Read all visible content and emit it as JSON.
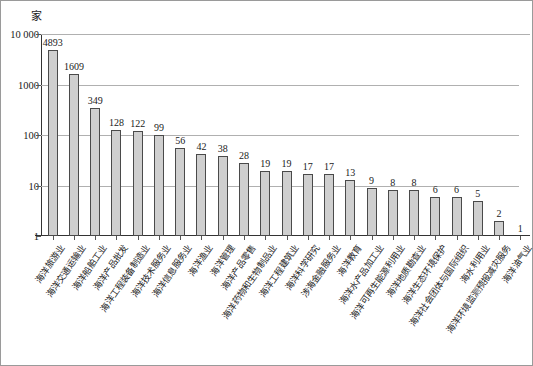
{
  "figure": {
    "unit_label": "家",
    "border_color": "#9a9a9a"
  },
  "chart_data": {
    "type": "bar",
    "title": "",
    "subtitle": "",
    "xlabel": "",
    "ylabel": "家",
    "yscale": "log",
    "ylim": [
      1,
      10000
    ],
    "grid": true,
    "legend": "none",
    "ytick_labels": [
      "1",
      "10",
      "100",
      "1000",
      "10 000"
    ],
    "ytick_values": [
      1,
      10,
      100,
      1000,
      10000
    ],
    "bar_fill_color": "#cfcfcf",
    "bar_edge_color": "#4a4a4a",
    "categories": [
      "海洋旅游业",
      "海洋交通运输业",
      "海洋船舶工业",
      "海洋产品批发",
      "海洋工程装备制造业",
      "海洋技术服务业",
      "海洋信息服务业",
      "海洋渔业",
      "海洋管理",
      "海洋产品零售",
      "海洋药物和生物制品业",
      "海洋工程建筑业",
      "海洋科学研究",
      "涉海金融服务业",
      "海洋教育",
      "海洋水产品加工业",
      "海洋可再生能源利用业",
      "海洋地质勘查业",
      "海洋生态环境保护",
      "海洋社会团体与国际组织",
      "海水利用业",
      "海洋环境监测预报减灾服务",
      "海洋油气业"
    ],
    "values": [
      4893,
      1609,
      349,
      128,
      122,
      99,
      56,
      42,
      38,
      28,
      19,
      19,
      17,
      17,
      13,
      9,
      8,
      8,
      6,
      6,
      5,
      2,
      1
    ],
    "value_labels": [
      "4893",
      "1609",
      "349",
      "128",
      "122",
      "99",
      "56",
      "42",
      "38",
      "28",
      "19",
      "19",
      "17",
      "17",
      "13",
      "9",
      "8",
      "8",
      "6",
      "6",
      "5",
      "2",
      "1"
    ]
  }
}
